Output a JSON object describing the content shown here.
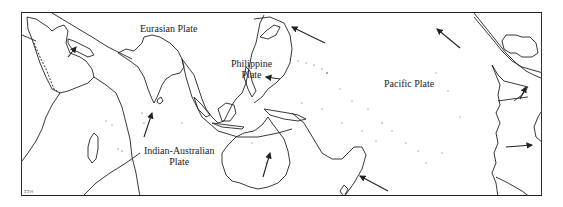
{
  "map": {
    "title": "Tectonic plates of the Indian and Pacific region",
    "labels": {
      "eurasian": "Eurasian Plate",
      "philippine_line1": "Philippine",
      "philippine_line2": "Plate",
      "pacific": "Pacific Plate",
      "indian_line1": "Indian-Australian",
      "indian_line2": "Plate"
    },
    "corner_mark": "ΣΣΗ",
    "colors": {
      "line": "#222222",
      "background": "#ffffff"
    },
    "arrows": [
      {
        "name": "arabian-plate-arrow",
        "direction": "northeast"
      },
      {
        "name": "indian-plate-arrow",
        "direction": "north"
      },
      {
        "name": "australian-plate-arrow",
        "direction": "north"
      },
      {
        "name": "philippine-plate-arrow",
        "direction": "west"
      },
      {
        "name": "pacific-plate-arrow-1",
        "direction": "northwest"
      },
      {
        "name": "pacific-plate-arrow-2",
        "direction": "northwest"
      },
      {
        "name": "pacific-plate-arrow-3",
        "direction": "northwest"
      },
      {
        "name": "nazca-plate-arrow",
        "direction": "east"
      },
      {
        "name": "cocos-plate-arrow",
        "direction": "northeast"
      }
    ]
  }
}
